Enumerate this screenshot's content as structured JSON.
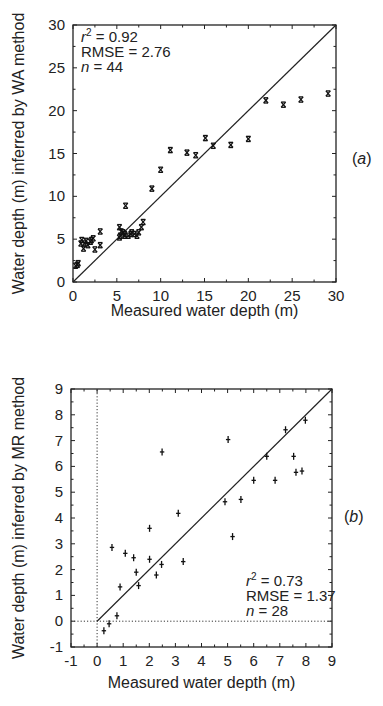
{
  "chart_data": [
    {
      "id": "a",
      "type": "scatter",
      "panel_label": "(a)",
      "title": "",
      "xlabel": "Measured water depth (m)",
      "ylabel": "Water depth (m) inferred by WA method",
      "xlim": [
        0,
        30
      ],
      "ylim": [
        0,
        30
      ],
      "xticks": [
        0,
        5,
        10,
        15,
        20,
        25,
        30
      ],
      "yticks": [
        0,
        5,
        10,
        15,
        20,
        25,
        30
      ],
      "marker": "x",
      "reference_line": "1:1",
      "grid": false,
      "annotations": [
        "r² = 0.92",
        "RMSE = 2.76",
        "n = 44"
      ],
      "stats": {
        "r2": 0.92,
        "rmse": 2.76,
        "n": 44
      },
      "points": [
        [
          29.1,
          22.0
        ],
        [
          26.0,
          21.3
        ],
        [
          24.0,
          20.7
        ],
        [
          22.0,
          21.2
        ],
        [
          20.0,
          16.7
        ],
        [
          18.0,
          16.0
        ],
        [
          16.0,
          15.9
        ],
        [
          15.1,
          16.8
        ],
        [
          14.0,
          14.8
        ],
        [
          13.0,
          15.1
        ],
        [
          11.1,
          15.4
        ],
        [
          10.0,
          13.1
        ],
        [
          9.0,
          10.9
        ],
        [
          6.0,
          8.9
        ],
        [
          8.0,
          7.0
        ],
        [
          7.8,
          6.4
        ],
        [
          7.5,
          5.8
        ],
        [
          7.3,
          5.4
        ],
        [
          7.0,
          5.6
        ],
        [
          6.6,
          5.6
        ],
        [
          6.3,
          5.4
        ],
        [
          5.9,
          5.6
        ],
        [
          5.7,
          5.8
        ],
        [
          5.5,
          5.9
        ],
        [
          5.3,
          6.4
        ],
        [
          5.4,
          5.4
        ],
        [
          5.3,
          5.2
        ],
        [
          5.9,
          5.4
        ],
        [
          6.7,
          5.8
        ],
        [
          3.1,
          5.9
        ],
        [
          3.1,
          4.3
        ],
        [
          2.5,
          3.8
        ],
        [
          2.3,
          5.1
        ],
        [
          2.0,
          4.7
        ],
        [
          1.7,
          4.3
        ],
        [
          1.3,
          4.5
        ],
        [
          1.0,
          4.9
        ],
        [
          0.9,
          4.5
        ],
        [
          1.2,
          3.9
        ],
        [
          1.5,
          4.8
        ],
        [
          2.1,
          4.9
        ],
        [
          0.5,
          2.0
        ],
        [
          0.3,
          1.9
        ],
        [
          0.6,
          2.2
        ]
      ]
    },
    {
      "id": "b",
      "type": "scatter",
      "panel_label": "(b)",
      "title": "",
      "xlabel": "Measured water depth (m)",
      "ylabel": "Water depth (m) inferred by MR method",
      "xlim": [
        -1,
        9
      ],
      "ylim": [
        -1,
        9
      ],
      "xticks": [
        -1,
        0,
        1,
        2,
        3,
        4,
        5,
        6,
        7,
        8,
        9
      ],
      "yticks": [
        -1,
        0,
        1,
        2,
        3,
        4,
        5,
        6,
        7,
        8,
        9
      ],
      "marker": "+",
      "reference_line": "1:1 from (0,0)",
      "zero_lines": "dotted",
      "grid": false,
      "annotations": [
        "r² = 0.73",
        "RMSE = 1.37",
        "n = 28"
      ],
      "stats": {
        "r2": 0.73,
        "rmse": 1.37,
        "n": 28
      },
      "points": [
        [
          0.26,
          -0.37
        ],
        [
          0.46,
          -0.1
        ],
        [
          0.76,
          0.21
        ],
        [
          0.57,
          2.86
        ],
        [
          0.88,
          1.33
        ],
        [
          1.08,
          2.63
        ],
        [
          1.4,
          2.46
        ],
        [
          1.5,
          1.9
        ],
        [
          1.59,
          1.38
        ],
        [
          2.01,
          3.6
        ],
        [
          2.01,
          2.4
        ],
        [
          2.27,
          1.79
        ],
        [
          2.47,
          2.2
        ],
        [
          2.49,
          6.56
        ],
        [
          3.11,
          4.18
        ],
        [
          3.3,
          2.31
        ],
        [
          4.9,
          4.63
        ],
        [
          5.02,
          7.04
        ],
        [
          5.19,
          3.28
        ],
        [
          5.51,
          4.72
        ],
        [
          6.0,
          5.46
        ],
        [
          6.5,
          6.39
        ],
        [
          6.82,
          5.46
        ],
        [
          7.22,
          7.42
        ],
        [
          7.53,
          6.39
        ],
        [
          7.62,
          5.77
        ],
        [
          7.85,
          5.82
        ],
        [
          7.98,
          7.79
        ]
      ]
    }
  ],
  "layout": {
    "a": {
      "x0": 73,
      "x1": 336,
      "y0": 282,
      "y1": 25,
      "panel_label_x": 352,
      "panel_label_y": 164,
      "annot_x": 81,
      "annot_y": 42,
      "xlabel_y": 316,
      "ylabel_x": 24
    },
    "b": {
      "x0": 71,
      "x1": 332,
      "y0": 647,
      "y1": 389,
      "panel_label_x": 344,
      "panel_label_y": 522,
      "annot_x": 246,
      "annot_y": 586,
      "xlabel_y": 688,
      "ylabel_x": 24
    }
  }
}
